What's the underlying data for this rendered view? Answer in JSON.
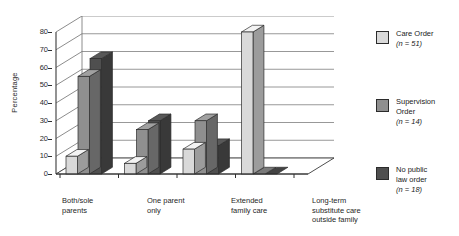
{
  "chart_data": {
    "type": "bar",
    "title": "",
    "subtitle": "",
    "xlabel": "",
    "ylabel": "Percentage",
    "ylim": [
      0,
      80
    ],
    "ytick_step": 10,
    "yticks": [
      80,
      70,
      60,
      50,
      40,
      30,
      20,
      10,
      0
    ],
    "grid": true,
    "three_d": true,
    "legend_position": "right",
    "categories": [
      "Both/sole\nparents",
      "One parent\nonly",
      "Extended\nfamily care",
      "Long-term\nsubstitute care\noutside family"
    ],
    "series": [
      {
        "name": "Care Order",
        "n_label": "(n = 51)",
        "color": "#d9d9d9",
        "values": [
          10,
          6,
          14,
          80
        ]
      },
      {
        "name": "Supervision\nOrder",
        "n_label": "(n = 14)",
        "color": "#8f8f8f",
        "values": [
          55,
          25,
          30,
          0
        ]
      },
      {
        "name": "No public\nlaw order",
        "n_label": "(n = 18)",
        "color": "#4f4f4f",
        "values": [
          65,
          30,
          16,
          0
        ]
      }
    ]
  },
  "axis": {
    "ylabel": "Percentage",
    "ticks": [
      "80",
      "70",
      "60",
      "50",
      "40",
      "30",
      "20",
      "10",
      "0"
    ]
  },
  "categories": [
    {
      "label": "Both/sole\nparents"
    },
    {
      "label": "One parent\nonly"
    },
    {
      "label": "Extended\nfamily care"
    },
    {
      "label": "Long-term\nsubstitute care\noutside family"
    }
  ],
  "legend": {
    "items": [
      {
        "label": "Care Order",
        "n": "(n = 51)",
        "color": "#d9d9d9"
      },
      {
        "label": "Supervision\nOrder",
        "n": "(n = 14)",
        "color": "#8f8f8f"
      },
      {
        "label": "No public\nlaw order",
        "n": "(n = 18)",
        "color": "#4f4f4f"
      }
    ]
  }
}
